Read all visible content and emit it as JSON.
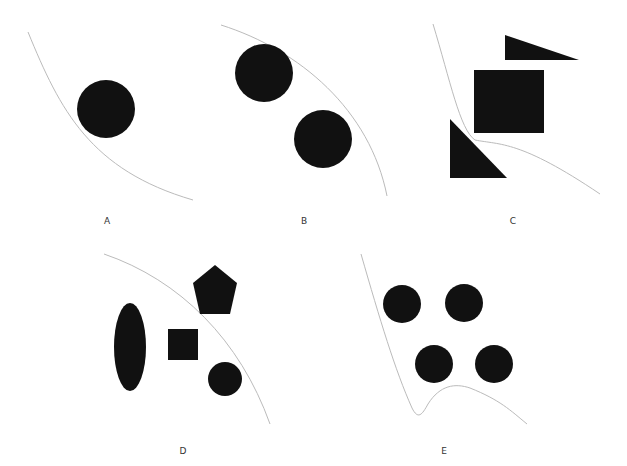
{
  "panels": [
    {
      "label": "A",
      "description": "one circle touching a curve"
    },
    {
      "label": "B",
      "description": "two circles under a curve"
    },
    {
      "label": "C",
      "description": "square and two triangles around a curve"
    },
    {
      "label": "D",
      "description": "ellipse, square, pentagon and circle with a curve"
    },
    {
      "label": "E",
      "description": "four circles above a curve"
    }
  ],
  "colors": {
    "shape": "#111111",
    "curve": "#bbbbbb",
    "background": "#ffffff"
  }
}
